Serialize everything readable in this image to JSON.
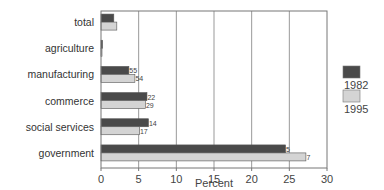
{
  "chart_data": {
    "type": "bar",
    "orientation": "horizontal",
    "title": "",
    "xlabel": "Percent",
    "ylabel": "",
    "xlim": [
      0,
      30
    ],
    "xticks": [
      0,
      5,
      10,
      15,
      20,
      25,
      30
    ],
    "grid": true,
    "legend_position": "right",
    "categories": [
      "total",
      "agriculture",
      "manufacturing",
      "commerce",
      "social services",
      "government"
    ],
    "series": [
      {
        "name": "1982",
        "color": "#4a4a4a",
        "values": [
          1.7,
          0.2,
          3.7,
          6.1,
          6.3,
          24.5
        ],
        "labels": [
          "",
          "",
          "55",
          "22",
          "14",
          "5"
        ]
      },
      {
        "name": "1995",
        "color": "#d4d4d4",
        "values": [
          2.1,
          0.1,
          4.5,
          5.9,
          5.1,
          27.2
        ],
        "labels": [
          "",
          "",
          "54",
          "29",
          "17",
          "7"
        ]
      }
    ]
  }
}
